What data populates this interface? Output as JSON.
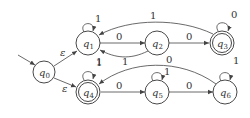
{
  "diagram": {
    "type": "finite-automaton",
    "states": [
      {
        "id": "q0",
        "name": "q",
        "sub": "0",
        "x": 44,
        "y": 72,
        "accepting": false,
        "initial": true
      },
      {
        "id": "q1",
        "name": "q",
        "sub": "1",
        "x": 88,
        "y": 43,
        "accepting": false
      },
      {
        "id": "q2",
        "name": "q",
        "sub": "2",
        "x": 157,
        "y": 43,
        "accepting": false
      },
      {
        "id": "q3",
        "name": "q",
        "sub": "3",
        "x": 222,
        "y": 43,
        "accepting": true
      },
      {
        "id": "q4",
        "name": "q",
        "sub": "4",
        "x": 88,
        "y": 92,
        "accepting": true
      },
      {
        "id": "q5",
        "name": "q",
        "sub": "5",
        "x": 157,
        "y": 92,
        "accepting": false
      },
      {
        "id": "q6",
        "name": "q",
        "sub": "6",
        "x": 225,
        "y": 92,
        "accepting": false
      }
    ],
    "transitions": [
      {
        "from": "q0",
        "to": "q1",
        "label": "ε"
      },
      {
        "from": "q0",
        "to": "q4",
        "label": "ε"
      },
      {
        "from": "q1",
        "to": "q1",
        "label": "1"
      },
      {
        "from": "q1",
        "to": "q2",
        "label": "0"
      },
      {
        "from": "q2",
        "to": "q1",
        "label": "1"
      },
      {
        "from": "q2",
        "to": "q3",
        "label": "0"
      },
      {
        "from": "q3",
        "to": "q1",
        "label": "1"
      },
      {
        "from": "q3",
        "to": "q3",
        "label": "0"
      },
      {
        "from": "q4",
        "to": "q4",
        "label": "1"
      },
      {
        "from": "q4",
        "to": "q5",
        "label": "0"
      },
      {
        "from": "q5",
        "to": "q5",
        "label": "1"
      },
      {
        "from": "q5",
        "to": "q6",
        "label": "0"
      },
      {
        "from": "q6",
        "to": "q6",
        "label": "1"
      },
      {
        "from": "q6",
        "to": "q4",
        "label": "0"
      }
    ]
  }
}
